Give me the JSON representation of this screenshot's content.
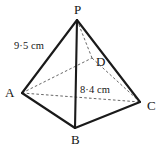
{
  "figure": {
    "kind": "square-based-pyramid-diagram",
    "background_color": "#ffffff",
    "stroke_color": "#1a1a1a",
    "hidden_stroke_color": "#555555",
    "width": 163,
    "height": 151
  },
  "vertices": [
    {
      "id": "P",
      "label": "P",
      "role": "apex",
      "x": 77,
      "y": 20,
      "label_x": 74,
      "label_y": 3,
      "hidden": false
    },
    {
      "id": "A",
      "label": "A",
      "role": "base-corner",
      "x": 22,
      "y": 93,
      "label_x": 5,
      "label_y": 86,
      "hidden": false
    },
    {
      "id": "B",
      "label": "B",
      "role": "base-corner",
      "x": 75,
      "y": 128,
      "label_x": 71,
      "label_y": 133,
      "hidden": false
    },
    {
      "id": "C",
      "label": "C",
      "role": "base-corner",
      "x": 140,
      "y": 102,
      "label_x": 147,
      "label_y": 99,
      "hidden": false
    },
    {
      "id": "D",
      "label": "D",
      "role": "base-corner",
      "x": 92,
      "y": 58,
      "label_x": 96,
      "label_y": 55,
      "hidden": true
    }
  ],
  "edges": [
    {
      "id": "PA",
      "from": "P",
      "to": "A",
      "style": "solid",
      "x1": 77,
      "y1": 20,
      "x2": 22,
      "y2": 93
    },
    {
      "id": "PC",
      "from": "P",
      "to": "C",
      "style": "solid",
      "x1": 77,
      "y1": 20,
      "x2": 140,
      "y2": 102
    },
    {
      "id": "PB",
      "from": "P",
      "to": "B",
      "style": "solid",
      "x1": 77,
      "y1": 20,
      "x2": 75,
      "y2": 128
    },
    {
      "id": "AB",
      "from": "A",
      "to": "B",
      "style": "solid",
      "x1": 22,
      "y1": 93,
      "x2": 75,
      "y2": 128
    },
    {
      "id": "BC",
      "from": "B",
      "to": "C",
      "style": "solid",
      "x1": 75,
      "y1": 128,
      "x2": 140,
      "y2": 102
    },
    {
      "id": "PD",
      "from": "P",
      "to": "D",
      "style": "hidden",
      "x1": 77,
      "y1": 20,
      "x2": 92,
      "y2": 58
    },
    {
      "id": "AD",
      "from": "A",
      "to": "D",
      "style": "hidden",
      "x1": 22,
      "y1": 93,
      "x2": 92,
      "y2": 58
    },
    {
      "id": "DC",
      "from": "D",
      "to": "C",
      "style": "hidden",
      "x1": 92,
      "y1": 58,
      "x2": 140,
      "y2": 102
    },
    {
      "id": "AC",
      "from": "A",
      "to": "C",
      "style": "hidden",
      "x1": 22,
      "y1": 93,
      "x2": 140,
      "y2": 102
    }
  ],
  "measurements": [
    {
      "id": "slant-edge-length",
      "text": "9·5 cm",
      "refers_to_edge": "PA",
      "x": 14,
      "y": 41
    },
    {
      "id": "base-diagonal-length",
      "text": "8·4 cm",
      "refers_to_edge": "AC",
      "x": 80,
      "y": 85
    }
  ]
}
